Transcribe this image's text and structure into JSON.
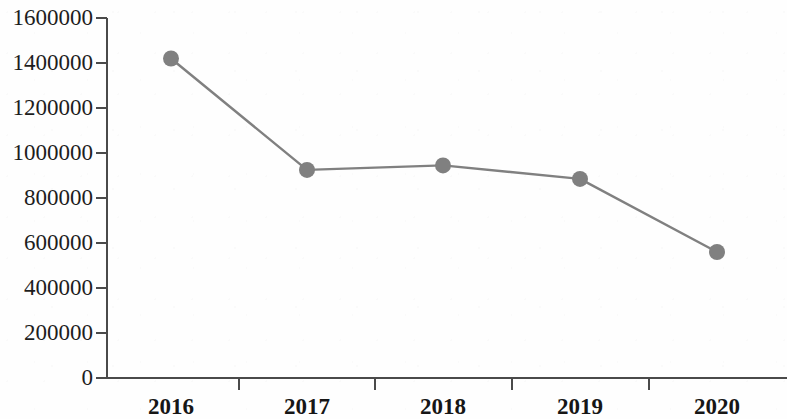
{
  "chart_data": {
    "type": "line",
    "title": "",
    "subtitle": "",
    "xlabel": "",
    "ylabel": "",
    "categories": [
      "2016",
      "2017",
      "2018",
      "2019",
      "2020"
    ],
    "values": [
      1420000,
      925000,
      945000,
      885000,
      560000
    ],
    "series": [
      {
        "name": "",
        "values": [
          1420000,
          925000,
          945000,
          885000,
          560000
        ]
      }
    ],
    "ylim": [
      0,
      1600000
    ],
    "ytick_step": 200000,
    "ytick_labels": [
      "0",
      "200000",
      "400000",
      "600000",
      "800000",
      "1000000",
      "1200000",
      "1400000",
      "1600000"
    ],
    "ytick_values": [
      0,
      200000,
      400000,
      600000,
      800000,
      1000000,
      1200000,
      1400000,
      1600000
    ],
    "xtick_labels": [
      "2016",
      "2017",
      "2018",
      "2019",
      "2020"
    ],
    "grid": false,
    "legend": null,
    "legend_position": "none",
    "annotations": [],
    "colors": {
      "line": "#808080",
      "marker": "#808080",
      "axis": "#4a4a4a",
      "text": "#1d1d1d",
      "background": "#fefefe"
    },
    "marker_style": "circle",
    "marker_radius": 8,
    "line_width": 2
  },
  "axes": {
    "y_axis_name": "y-axis",
    "x_axis_name": "x-axis"
  }
}
